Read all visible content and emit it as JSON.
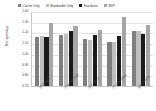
{
  "chart_data": {
    "type": "bar",
    "title": "",
    "xlabel": "",
    "ylabel": "Net speedup",
    "ylim": [
      0.7,
      1.4
    ],
    "ytick_labels": [
      "1.40",
      "1.30",
      "1.20",
      "1.10",
      "1.00",
      "0.90",
      "0.80",
      "0.70"
    ],
    "ytick_values": [
      1.4,
      1.3,
      1.2,
      1.1,
      1.0,
      0.9,
      0.8,
      0.7
    ],
    "grid": true,
    "legend_position": "top",
    "categories": [
      "(fft,bzip2)",
      "(equake,mcf)",
      "(art,swim)",
      "(mesa,lucas)",
      "(gzip,twolf)"
    ],
    "series": [
      {
        "name": "Cache Only",
        "color": "#7f7f7f",
        "values": [
          1.16,
          1.18,
          1.14,
          1.11,
          1.21
        ]
      },
      {
        "name": "Bandwidth Only",
        "color": "#bfbfbf",
        "values": [
          1.17,
          1.19,
          1.13,
          1.11,
          1.21
        ]
      },
      {
        "name": "Fairshare",
        "color": "#1a1a1a",
        "values": [
          1.16,
          1.21,
          1.18,
          1.17,
          1.19
        ]
      },
      {
        "name": "SRP",
        "color": "#a6a6a6",
        "values": [
          1.29,
          1.26,
          1.22,
          1.34,
          1.27
        ]
      }
    ]
  }
}
